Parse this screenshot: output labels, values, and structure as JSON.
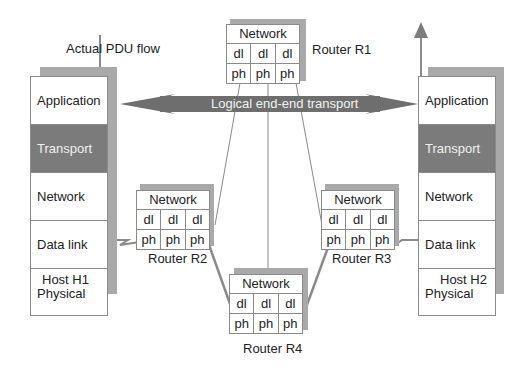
{
  "labels": {
    "pdu_flow": "Actual PDU flow",
    "logical_transport": "Logical end-end transport"
  },
  "hosts": [
    {
      "name": "Host H1",
      "layers": [
        "Application",
        "Transport",
        "Network",
        "Data link",
        "Physical"
      ],
      "highlight": "Transport"
    },
    {
      "name": "Host H2",
      "layers": [
        "Application",
        "Transport",
        "Network",
        "Data link",
        "Physical"
      ],
      "highlight": "Transport"
    }
  ],
  "routers": [
    {
      "name": "Router R1",
      "top": "Network",
      "dl": [
        "dl",
        "dl",
        "dl"
      ],
      "ph": [
        "ph",
        "ph",
        "ph"
      ]
    },
    {
      "name": "Router R2",
      "top": "Network",
      "dl": [
        "dl",
        "dl",
        "dl"
      ],
      "ph": [
        "ph",
        "ph",
        "ph"
      ]
    },
    {
      "name": "Router R3",
      "top": "Network",
      "dl": [
        "dl",
        "dl",
        "dl"
      ],
      "ph": [
        "ph",
        "ph",
        "ph"
      ]
    },
    {
      "name": "Router R4",
      "top": "Network",
      "dl": [
        "dl",
        "dl",
        "dl"
      ],
      "ph": [
        "ph",
        "ph",
        "ph"
      ]
    }
  ],
  "colors": {
    "transport_fill": "#7b7b7b",
    "arrow_fill": "#6e6e6e",
    "shadow": "#a9a9a9",
    "line": "#8a8a8a"
  }
}
